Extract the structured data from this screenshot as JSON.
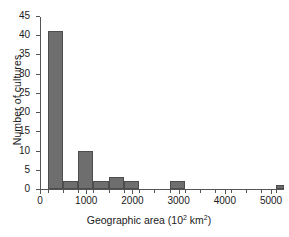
{
  "chart_data": {
    "type": "bar",
    "title": "",
    "subtitle": "",
    "xlabel_text": "Geographic area (10",
    "xlabel_sup": "2",
    "xlabel_tail": " km",
    "xlabel_sup2": "2",
    "xlabel_close": ")",
    "xlabel": "Geographic area (10^2 km^2)",
    "ylabel": "Number of cultures",
    "grid": false,
    "legend": null,
    "xlim": [
      0,
      5280
    ],
    "ylim": [
      0,
      45
    ],
    "bin_width": 330,
    "x_ticks": [
      0,
      1000,
      2000,
      3000,
      4000,
      5000
    ],
    "x_tick_labels": [
      "0",
      "1000",
      "2000",
      "3000",
      "4000",
      "5000"
    ],
    "x_minor_ticks": [
      165,
      495,
      825,
      1155,
      1485,
      1815,
      2145,
      2475,
      2805,
      3135,
      3465,
      3795,
      4125,
      4455,
      4785,
      5115
    ],
    "y_ticks": [
      0,
      5,
      10,
      15,
      20,
      25,
      30,
      35,
      40,
      45
    ],
    "y_tick_labels": [
      "0",
      "5",
      "10",
      "15",
      "20",
      "25",
      "30",
      "35",
      "40",
      "45"
    ],
    "bar_color": "#6e6e6e",
    "bar_edge_color": "#4d4d4d",
    "axis_color": "#555555",
    "bins": [
      {
        "x0": 165,
        "x1": 495,
        "value": 41
      },
      {
        "x0": 495,
        "x1": 825,
        "value": 2
      },
      {
        "x0": 825,
        "x1": 1155,
        "value": 10
      },
      {
        "x0": 1155,
        "x1": 1485,
        "value": 2
      },
      {
        "x0": 1485,
        "x1": 1815,
        "value": 3
      },
      {
        "x0": 1815,
        "x1": 2145,
        "value": 2
      },
      {
        "x0": 2145,
        "x1": 2475,
        "value": 0
      },
      {
        "x0": 2475,
        "x1": 2805,
        "value": 0
      },
      {
        "x0": 2805,
        "x1": 3135,
        "value": 2
      },
      {
        "x0": 3135,
        "x1": 3465,
        "value": 0
      },
      {
        "x0": 3465,
        "x1": 3795,
        "value": 0
      },
      {
        "x0": 3795,
        "x1": 4125,
        "value": 0
      },
      {
        "x0": 4125,
        "x1": 4455,
        "value": 0
      },
      {
        "x0": 4455,
        "x1": 4785,
        "value": 0
      },
      {
        "x0": 4785,
        "x1": 5115,
        "value": 0
      },
      {
        "x0": 5115,
        "x1": 5445,
        "value": 1
      }
    ],
    "categories": [
      "165-495",
      "495-825",
      "825-1155",
      "1155-1485",
      "1485-1815",
      "1815-2145",
      "2145-2475",
      "2475-2805",
      "2805-3135",
      "3135-3465",
      "3465-3795",
      "3795-4125",
      "4125-4455",
      "4455-4785",
      "4785-5115",
      "5115-5445"
    ],
    "values": [
      41,
      2,
      10,
      2,
      3,
      2,
      0,
      0,
      2,
      0,
      0,
      0,
      0,
      0,
      0,
      1
    ]
  }
}
